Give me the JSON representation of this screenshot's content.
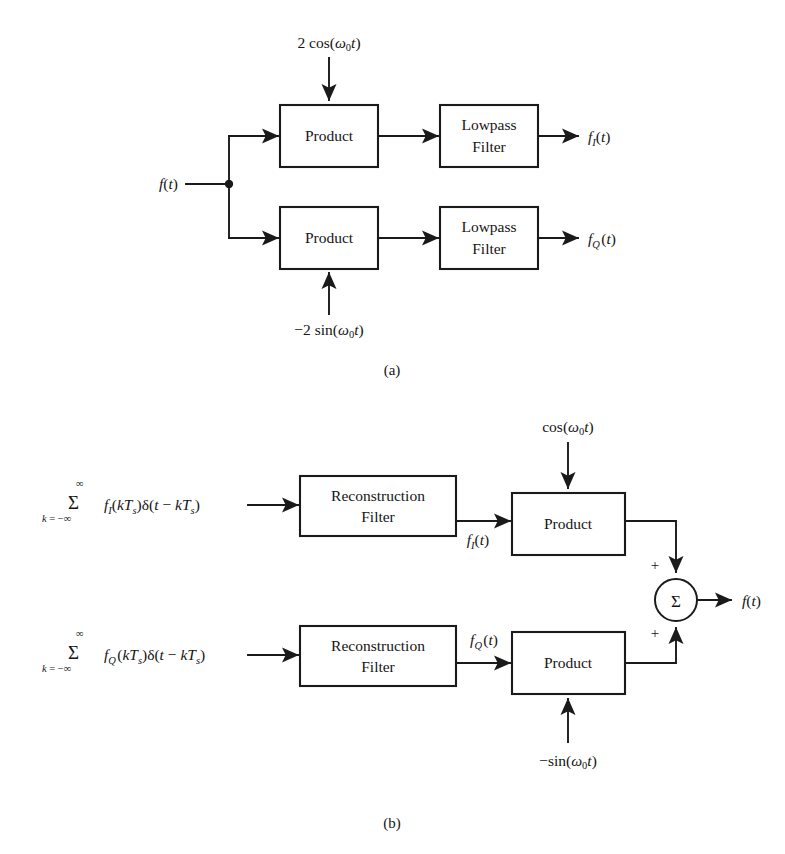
{
  "figure": {
    "captions": {
      "a": "(a)",
      "b": "(b)"
    }
  },
  "part_a": {
    "name": "QAM demodulator",
    "input_label": "f(t)",
    "carrier_top": "2 cos(ω0t)",
    "carrier_bottom": "−2 sin(ω0t)",
    "blocks": [
      {
        "id": "product-top",
        "label": "Product"
      },
      {
        "id": "lowpass-top",
        "label_line1": "Lowpass",
        "label_line2": "Filter"
      },
      {
        "id": "product-bottom",
        "label": "Product"
      },
      {
        "id": "lowpass-bottom",
        "label_line1": "Lowpass",
        "label_line2": "Filter"
      }
    ],
    "output_top": "fI(t)",
    "output_bottom": "fQ(t)"
  },
  "part_b": {
    "name": "QAM signal reconstruction",
    "input_top": "Σ k=-∞ to ∞  fI(kTs)δ(t − kTs)",
    "input_bottom": "Σ k=-∞ to ∞  fQ(kTs)δ(t − kTs)",
    "blocks": [
      {
        "id": "reconstruction-top",
        "label_line1": "Reconstruction",
        "label_line2": "Filter"
      },
      {
        "id": "product-top",
        "label": "Product"
      },
      {
        "id": "reconstruction-bottom",
        "label_line1": "Reconstruction",
        "label_line2": "Filter"
      },
      {
        "id": "product-bottom",
        "label": "Product"
      }
    ],
    "intermediate_top": "fI(t)",
    "intermediate_bottom": "fQ(t)",
    "carrier_top": "cos(ω0t)",
    "carrier_bottom": "−sin(ω0t)",
    "summer": {
      "glyph": "Σ",
      "sign_top": "+",
      "sign_bottom": "+"
    },
    "output_label": "f(t)"
  },
  "colors": {
    "ink": "#1a1a1a",
    "background": "#ffffff"
  }
}
